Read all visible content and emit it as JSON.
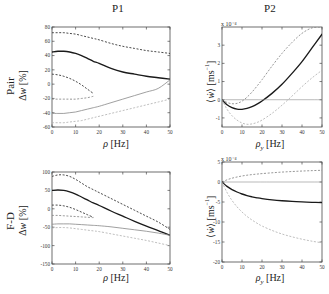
{
  "figure": {
    "column_titles": [
      "P1",
      "P2"
    ],
    "row_labels": [
      "Pair",
      "F-D"
    ]
  },
  "chart_data": [
    {
      "id": "pair-p1",
      "type": "line",
      "title": "P1",
      "row_label": "Pair",
      "xlabel": "ρ [Hz]",
      "ylabel": "Δw [%]",
      "xlim": [
        0,
        50
      ],
      "ylim": [
        -60,
        80
      ],
      "xticks": [
        0,
        10,
        20,
        30,
        40,
        50
      ],
      "yticks": [
        -60,
        -40,
        -20,
        0,
        20,
        40,
        60,
        80
      ],
      "grid": false,
      "legend": "none",
      "x": [
        0,
        2.5,
        5,
        7.5,
        10,
        12.5,
        15,
        17.5,
        20,
        25,
        30,
        35,
        40,
        45,
        50
      ],
      "series": [
        {
          "name": "upper-dashed-dark",
          "style": "dashed",
          "color": "#2b2b2b",
          "values": [
            72,
            72,
            72,
            71,
            70,
            68,
            66,
            64,
            62,
            57,
            53,
            50,
            47,
            45,
            43
          ]
        },
        {
          "name": "mean-solid-dark",
          "style": "solid",
          "color": "#1a1a1a",
          "values": [
            45,
            46,
            46,
            45,
            43,
            40,
            36,
            32,
            29,
            22,
            17,
            14,
            11,
            9,
            7
          ]
        },
        {
          "name": "inner-upper-dashed-dark",
          "style": "dashed",
          "color": "#2b2b2b",
          "truncated_at_x": 17,
          "values": [
            14,
            13,
            11,
            8,
            4,
            -1,
            -7,
            -13,
            null,
            null,
            null,
            null,
            null,
            null,
            null
          ]
        },
        {
          "name": "inner-lower-dashed-mid",
          "style": "dashed",
          "color": "#7d7d7d",
          "truncated_at_x": 17,
          "values": [
            -21,
            -21,
            -21,
            -21,
            -21,
            -20,
            -19,
            -17,
            null,
            null,
            null,
            null,
            null,
            null,
            null
          ]
        },
        {
          "name": "lower-solid-mid",
          "style": "solid",
          "color": "#8f8f8f",
          "values": [
            -41,
            -41,
            -41,
            -40,
            -39,
            -37,
            -35,
            -33,
            -31,
            -26,
            -21,
            -16,
            -11,
            -6,
            6
          ]
        },
        {
          "name": "lower-dashed-light",
          "style": "dashed",
          "color": "#adadad",
          "values": [
            -54,
            -54,
            -54,
            -53,
            -52,
            -51,
            -49,
            -47,
            -45,
            -41,
            -37,
            -33,
            -29,
            -25,
            -21
          ]
        }
      ]
    },
    {
      "id": "pair-p2",
      "type": "line",
      "title": "P2",
      "row_label": "Pair",
      "xlabel": "ρ_y [Hz]",
      "ylabel": "⟨ẇ⟩ [ms⁻¹]",
      "y_exponent": "x 10⁻⁴",
      "xlim": [
        0,
        50
      ],
      "ylim": [
        -1.5,
        4
      ],
      "xticks": [
        0,
        10,
        20,
        30,
        40,
        50
      ],
      "yticks": [
        -1,
        0,
        1,
        2,
        3
      ],
      "grid": false,
      "legend": "none",
      "x": [
        0,
        2.5,
        5,
        7.5,
        10,
        12.5,
        15,
        17.5,
        20,
        25,
        30,
        35,
        40,
        45,
        50
      ],
      "series": [
        {
          "name": "upper-dashed-mid",
          "style": "dashed",
          "color": "#7d7d7d",
          "values": [
            0.0,
            -0.15,
            -0.22,
            -0.2,
            -0.08,
            0.14,
            0.42,
            0.75,
            1.1,
            1.85,
            2.55,
            3.15,
            3.65,
            3.95,
            4.0
          ]
        },
        {
          "name": "mean-solid-dark",
          "style": "solid",
          "color": "#1a1a1a",
          "values": [
            0.0,
            -0.28,
            -0.44,
            -0.52,
            -0.53,
            -0.48,
            -0.38,
            -0.24,
            -0.07,
            0.35,
            0.85,
            1.45,
            2.1,
            2.85,
            3.6
          ]
        },
        {
          "name": "lower-dashed-light",
          "style": "dashed",
          "color": "#adadad",
          "values": [
            0.0,
            -0.52,
            -0.88,
            -1.12,
            -1.28,
            -1.35,
            -1.33,
            -1.25,
            -1.12,
            -0.75,
            -0.3,
            0.2,
            0.72,
            1.2,
            1.62
          ]
        },
        {
          "name": "zero-reference",
          "style": "solid-thin",
          "color": "#8a8a8a",
          "values": [
            0,
            0,
            0,
            0,
            0,
            0,
            0,
            0,
            0,
            0,
            0,
            0,
            0,
            0,
            0
          ]
        }
      ]
    },
    {
      "id": "fd-p1",
      "type": "line",
      "title": "P1",
      "row_label": "F-D",
      "xlabel": "ρ [Hz]",
      "ylabel": "Δw [%]",
      "xlim": [
        0,
        50
      ],
      "ylim": [
        -150,
        100
      ],
      "xticks": [
        0,
        10,
        20,
        30,
        40,
        50
      ],
      "yticks": [
        -150,
        -100,
        -50,
        0,
        50,
        100
      ],
      "grid": false,
      "legend": "none",
      "x": [
        0,
        2.5,
        5,
        7.5,
        10,
        12.5,
        15,
        17.5,
        20,
        25,
        30,
        35,
        40,
        45,
        50
      ],
      "series": [
        {
          "name": "upper-dashed-dark",
          "style": "dashed",
          "color": "#2b2b2b",
          "values": [
            88,
            92,
            92,
            88,
            80,
            70,
            60,
            52,
            44,
            28,
            12,
            -4,
            -20,
            -36,
            -56
          ]
        },
        {
          "name": "mean-solid-dark",
          "style": "solid",
          "color": "#1a1a1a",
          "values": [
            50,
            51,
            50,
            46,
            40,
            32,
            24,
            16,
            9,
            -6,
            -20,
            -34,
            -47,
            -59,
            -72
          ]
        },
        {
          "name": "inner-upper-dashed-dark",
          "style": "dashed",
          "color": "#2b2b2b",
          "truncated_at_x": 17,
          "values": [
            10,
            10,
            8,
            4,
            -2,
            -9,
            -16,
            -23,
            null,
            null,
            null,
            null,
            null,
            null,
            null
          ]
        },
        {
          "name": "inner-lower-dashed-mid",
          "style": "dashed",
          "color": "#7d7d7d",
          "truncated_at_x": 17,
          "values": [
            -18,
            -18,
            -19,
            -20,
            -21,
            -22,
            -23,
            -24,
            null,
            null,
            null,
            null,
            null,
            null,
            null
          ]
        },
        {
          "name": "lower-solid-mid",
          "style": "solid",
          "color": "#8f8f8f",
          "values": [
            -42,
            -41,
            -41,
            -41,
            -42,
            -43,
            -44,
            -45,
            -46,
            -49,
            -53,
            -57,
            -61,
            -66,
            -72
          ]
        },
        {
          "name": "lower-dashed-light",
          "style": "dashed",
          "color": "#adadad",
          "values": [
            -52,
            -51,
            -51,
            -52,
            -54,
            -56,
            -58,
            -60,
            -62,
            -68,
            -74,
            -80,
            -86,
            -93,
            -100
          ]
        }
      ]
    },
    {
      "id": "fd-p2",
      "type": "line",
      "title": "P2",
      "row_label": "F-D",
      "xlabel": "ρ_y [Hz]",
      "ylabel": "⟨ẇ⟩ [ms⁻¹]",
      "y_exponent": "x 10⁻⁴",
      "xlim": [
        0,
        50
      ],
      "ylim": [
        -20,
        5
      ],
      "xticks": [
        0,
        10,
        20,
        30,
        40,
        50
      ],
      "yticks": [
        -20,
        -15,
        -10,
        -5,
        0,
        5
      ],
      "grid": false,
      "legend": "none",
      "x": [
        0,
        2.5,
        5,
        7.5,
        10,
        12.5,
        15,
        17.5,
        20,
        25,
        30,
        35,
        40,
        45,
        50
      ],
      "series": [
        {
          "name": "upper-dashed-mid",
          "style": "dashed",
          "color": "#7d7d7d",
          "values": [
            0.0,
            0.55,
            0.95,
            1.25,
            1.5,
            1.7,
            1.85,
            1.98,
            2.1,
            2.3,
            2.48,
            2.62,
            2.74,
            2.84,
            2.93
          ]
        },
        {
          "name": "zero-reference",
          "style": "solid-thin",
          "color": "#8a8a8a",
          "values": [
            0,
            0,
            0,
            0,
            0,
            0,
            0,
            0,
            0,
            0,
            0,
            0,
            0,
            0,
            0
          ]
        },
        {
          "name": "mean-solid-dark",
          "style": "solid",
          "color": "#1a1a1a",
          "values": [
            0.0,
            -1.1,
            -1.9,
            -2.5,
            -3.0,
            -3.4,
            -3.7,
            -3.95,
            -4.15,
            -4.45,
            -4.68,
            -4.85,
            -4.98,
            -5.08,
            -5.15
          ]
        },
        {
          "name": "lower-dashed-light",
          "style": "dashed",
          "color": "#adadad",
          "values": [
            0.0,
            -2.6,
            -4.6,
            -6.2,
            -7.5,
            -8.6,
            -9.5,
            -10.3,
            -11.0,
            -12.1,
            -13.0,
            -13.7,
            -14.3,
            -14.8,
            -15.2
          ]
        }
      ]
    }
  ]
}
